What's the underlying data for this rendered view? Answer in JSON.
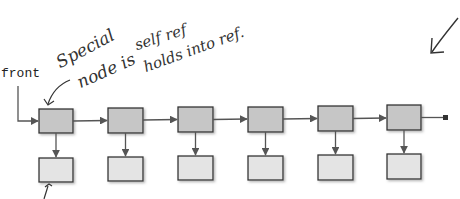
{
  "diagram": {
    "type": "linked-list-with-data-nodes",
    "head_label": "front",
    "annotations": [
      {
        "id": "special",
        "text": "Special"
      },
      {
        "id": "node-is",
        "text": "node is"
      },
      {
        "id": "self-ref",
        "text": "self ref"
      },
      {
        "id": "holds-into-ref",
        "text": "holds into ref."
      }
    ],
    "node_count": 6,
    "colors": {
      "list_node_fill": "#c6c6c6",
      "data_node_fill": "#e4e4e4",
      "border": "#333333",
      "connector": "#555555",
      "ink": "#333333"
    },
    "terminal": "null-square"
  }
}
